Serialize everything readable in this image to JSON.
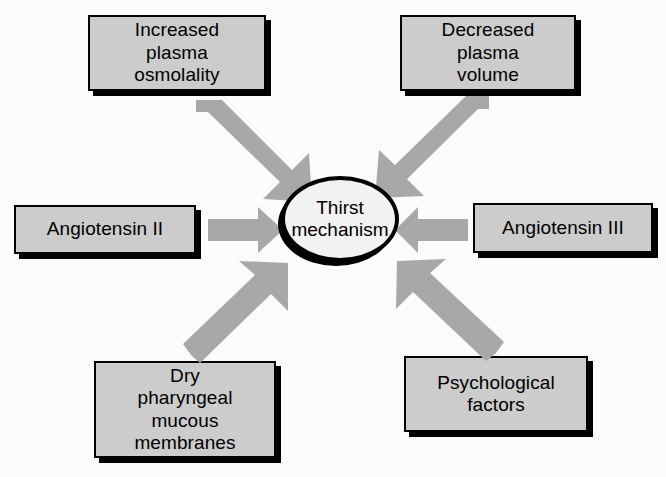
{
  "diagram": {
    "title": "Thirst mechanism",
    "colors": {
      "box_fill": "#cccccc",
      "box_border": "#000000",
      "arrow_fill": "#a8a8a8",
      "hub_fill": "#f2f2f2",
      "background": "#fbfbfb",
      "text": "#000000"
    },
    "hub": {
      "label": "Thirst\nmechanism"
    },
    "nodes": [
      {
        "id": "increased-plasma-osmolality",
        "label": "Increased\nplasma\nosmolality"
      },
      {
        "id": "decreased-plasma-volume",
        "label": "Decreased\nplasma\nvolume"
      },
      {
        "id": "angiotensin-ii",
        "label": "Angiotensin II"
      },
      {
        "id": "angiotensin-iii",
        "label": "Angiotensin III"
      },
      {
        "id": "dry-pharyngeal-mucous-membranes",
        "label": "Dry\npharyngeal\nmucous\nmembranes"
      },
      {
        "id": "psychological-factors",
        "label": "Psychological\nfactors"
      }
    ],
    "arrows": [
      {
        "id": "arrow-osmolality-to-hub",
        "from": "increased-plasma-osmolality",
        "to": "hub",
        "direction": "down-right"
      },
      {
        "id": "arrow-volume-to-hub",
        "from": "decreased-plasma-volume",
        "to": "hub",
        "direction": "down-left"
      },
      {
        "id": "arrow-angiotensin-ii-to-hub",
        "from": "angiotensin-ii",
        "to": "hub",
        "direction": "right"
      },
      {
        "id": "arrow-angiotensin-iii-to-hub",
        "from": "angiotensin-iii",
        "to": "hub",
        "direction": "left"
      },
      {
        "id": "arrow-membranes-to-hub",
        "from": "dry-pharyngeal-mucous-membranes",
        "to": "hub",
        "direction": "up-right"
      },
      {
        "id": "arrow-psychological-to-hub",
        "from": "psychological-factors",
        "to": "hub",
        "direction": "up-left"
      }
    ]
  }
}
